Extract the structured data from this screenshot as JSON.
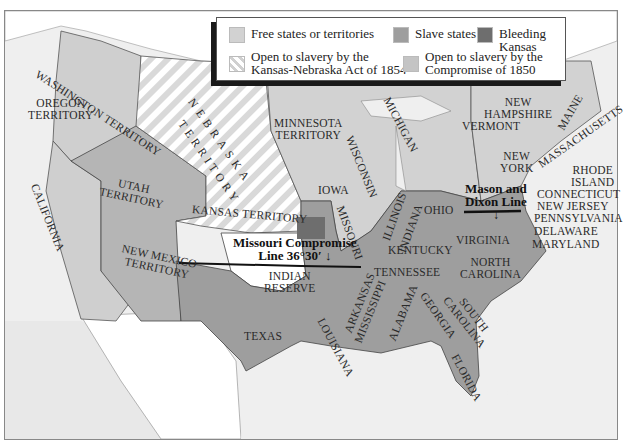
{
  "title_fragment": "...g p...",
  "colors": {
    "free": "#d2d2d2",
    "slave": "#9e9e9e",
    "bleeding_kansas": "#6e6e6e",
    "kansas_nebraska_open": "#e6e6e6",
    "compromise_1850_open": "#bdbdbd",
    "water": "#efefef",
    "foreign": "#ffffff"
  },
  "legend": {
    "items": [
      {
        "label": "Free states or territories",
        "swatch": "free"
      },
      {
        "label": "Slave states",
        "swatch": "slave"
      },
      {
        "label": "Bleeding Kansas",
        "swatch": "bleeding_kansas"
      },
      {
        "label_line1": "Open to slavery by the",
        "label_line2": "Kansas-Nebraska Act of 1854",
        "swatch": "hatched"
      },
      {
        "label_line1": "Open to slavery by the",
        "label_line2": "Compromise of 1850",
        "swatch": "compromise_1850_open"
      }
    ]
  },
  "regions": {
    "washington": "WASHINGTON TERRITORY",
    "oregon_1": "OREGON",
    "oregon_2": "TERRITORY",
    "california": "CALIFORNIA",
    "utah_1": "UTAH",
    "utah_2": "TERRITORY",
    "new_mexico_1": "NEW MEXICO",
    "new_mexico_2": "TERRITORY",
    "nebraska_1": "NEBRASKA",
    "nebraska_2": "TERRITORY",
    "kansas": "KANSAS TERRITORY",
    "indian_1": "INDIAN",
    "indian_2": "RESERVE",
    "texas": "TEXAS",
    "minnesota_1": "MINNESOTA",
    "minnesota_2": "TERRITORY",
    "iowa": "IOWA",
    "missouri": "MISSOURI",
    "wisconsin": "WISCONSIN",
    "illinois": "ILLINOIS",
    "michigan": "MICHIGAN",
    "indiana": "INDIANA",
    "ohio": "OHIO",
    "kentucky": "KENTUCKY",
    "tennessee": "TENNESSEE",
    "arkansas": "ARKANSAS",
    "louisiana": "LOUISIANA",
    "mississippi": "MISSISSIPPI",
    "alabama": "ALABAMA",
    "georgia": "GEORGIA",
    "florida": "FLORIDA",
    "south_carolina_1": "SOUTH",
    "south_carolina_2": "CAROLINA",
    "north_carolina_1": "NORTH",
    "north_carolina_2": "CAROLINA",
    "virginia": "VIRGINIA",
    "maryland": "MARYLAND",
    "delaware": "DELAWARE",
    "pennsylvania": "PENNSYLVANIA",
    "new_jersey": "NEW JERSEY",
    "connecticut": "CONNECTICUT",
    "rhode_island_1": "RHODE",
    "rhode_island_2": "ISLAND",
    "massachusetts": "MASSACHUSETTS",
    "new_york_1": "NEW",
    "new_york_2": "YORK",
    "vermont": "VERMONT",
    "new_hampshire_1": "NEW",
    "new_hampshire_2": "HAMPSHIRE",
    "maine": "MAINE"
  },
  "callouts": {
    "missouri_compromise_1": "Missouri Compromise",
    "missouri_compromise_2": "Line 36°30′",
    "mason_dixon_1": "Mason and",
    "mason_dixon_2": "Dixon Line",
    "arrow": "↓"
  }
}
